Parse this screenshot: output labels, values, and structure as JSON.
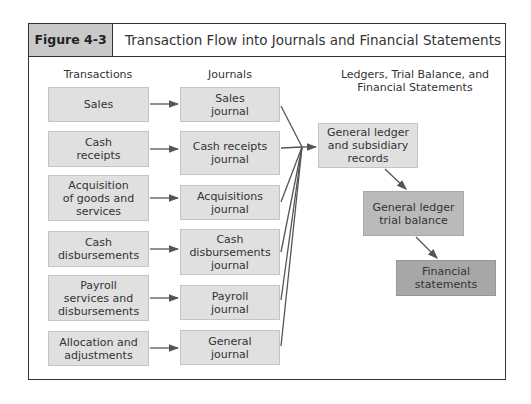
{
  "figure": {
    "label": "Figure 4-3",
    "title": "Transaction Flow into Journals and Financial Statements"
  },
  "columns": {
    "transactions": "Transactions",
    "journals": "Journals",
    "ledgers": "Ledgers, Trial Balance, and\nFinancial Statements"
  },
  "transactions": [
    {
      "label": "Sales"
    },
    {
      "label": "Cash\nreceipts"
    },
    {
      "label": "Acquisition\nof goods and\nservices"
    },
    {
      "label": "Cash\ndisbursements"
    },
    {
      "label": "Payroll\nservices and\ndisbursements"
    },
    {
      "label": "Allocation and\nadjustments"
    }
  ],
  "journals": [
    {
      "label": "Sales\njournal"
    },
    {
      "label": "Cash receipts\njournal"
    },
    {
      "label": "Acquisitions\njournal"
    },
    {
      "label": "Cash\ndisbursements\njournal"
    },
    {
      "label": "Payroll\njournal"
    },
    {
      "label": "General\njournal"
    }
  ],
  "ledgers": [
    {
      "label": "General ledger\nand subsidiary\nrecords"
    },
    {
      "label": "General ledger\ntrial balance"
    },
    {
      "label": "Financial\nstatements"
    }
  ],
  "colors": {
    "frame": "#333333",
    "figure_label_bg": "#c9c9c9",
    "box_light": "#e0e0e0",
    "box_mid": "#bababa",
    "box_dark": "#a7a7a7",
    "arrow": "#555555"
  }
}
